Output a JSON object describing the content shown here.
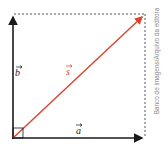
{
  "diagram": {
    "type": "vector-sum",
    "vectors": [
      {
        "name": "a",
        "label": "a",
        "color": "#1a1a1a",
        "direction": "horizontal"
      },
      {
        "name": "b",
        "label": "b",
        "color": "#1a1a1a",
        "direction": "vertical"
      },
      {
        "name": "s",
        "label": "s",
        "color": "#d9432a",
        "direction": "diagonal"
      }
    ],
    "right_angle_marker": true,
    "dashed_completion": true
  },
  "credit": "Banco de imagens/Arquivo da editora"
}
